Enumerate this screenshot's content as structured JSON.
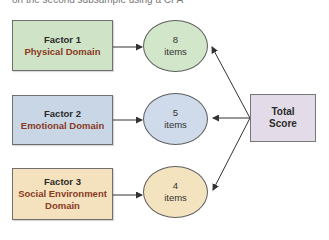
{
  "caption": "on the second subsample using a CFA",
  "factors": [
    {
      "title": "Factor 1",
      "domain": "Physical Domain",
      "items": "8",
      "items_label": "items",
      "fill": "#cfe3c6",
      "oval_fill": "#d2e6ca"
    },
    {
      "title": "Factor 2",
      "domain": "Emotional Domain",
      "items": "5",
      "items_label": "items",
      "fill": "#c9d6e6",
      "oval_fill": "#cfdbea"
    },
    {
      "title": "Factor 3",
      "domain": "Social Environment Domain",
      "items": "4",
      "items_label": "items",
      "fill": "#f3e2bd",
      "oval_fill": "#f3e4bf"
    }
  ],
  "total": {
    "line1": "Total",
    "line2": "Score",
    "fill": "#e3dce8"
  }
}
